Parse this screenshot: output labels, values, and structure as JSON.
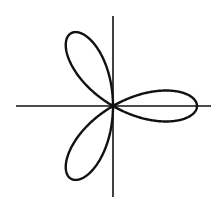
{
  "diagram": {
    "type": "polar-rose",
    "petals": 6,
    "petal_angles_deg": [
      0,
      60,
      120,
      180,
      240,
      300
    ],
    "center": [
      113,
      106
    ],
    "radius": 84,
    "axes": {
      "horizontal": {
        "x1": 16,
        "x2": 211,
        "y": 106
      },
      "vertical": {
        "y1": 16,
        "y2": 197,
        "x": 113
      }
    },
    "colors": {
      "stroke": "#111111",
      "background": "#ffffff"
    }
  }
}
